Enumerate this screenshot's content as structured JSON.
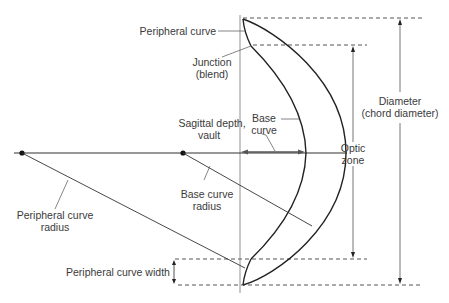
{
  "diagram": {
    "labels": {
      "peripheral_curve": "Peripheral curve",
      "junction_line1": "Junction",
      "junction_line2": "(blend)",
      "sagittal_line1": "Sagittal depth,",
      "sagittal_line2": "vault",
      "base_curve_line1": "Base",
      "base_curve_line2": "curve",
      "base_curve_radius_line1": "Base curve",
      "base_curve_radius_line2": "radius",
      "peripheral_curve_radius_line1": "Peripheral curve",
      "peripheral_curve_radius_line2": "radius",
      "peripheral_curve_width": "Peripheral curve width",
      "optic_zone_line1": "Optic",
      "optic_zone_line2": "zone",
      "diameter_line1": "Diameter",
      "diameter_line2": "(chord diameter)"
    },
    "colors": {
      "line": "#222222",
      "thin_line": "#555555",
      "dash": "#555555",
      "text": "#3a3a3a"
    }
  }
}
